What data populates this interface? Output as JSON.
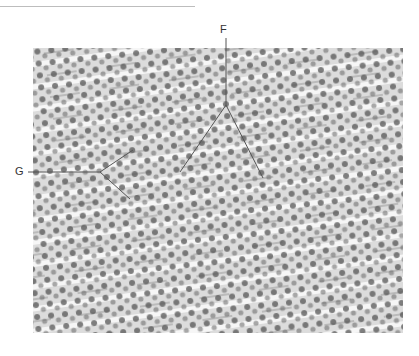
{
  "figure": {
    "labels": [
      {
        "id": "F",
        "text": "F"
      },
      {
        "id": "G",
        "text": "G"
      }
    ],
    "colors": {
      "background": "#ffffff",
      "tissue": "#e9e9e9",
      "nucleus": "#4a4a4a",
      "leader_line": "#555555"
    }
  }
}
